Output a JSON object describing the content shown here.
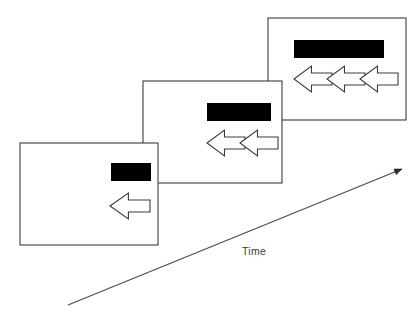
{
  "figure": {
    "name": "time-sequence-panels",
    "background_color": "#ffffff",
    "line_color": "#3c3c3c",
    "bar_color": "#000000",
    "width": 419,
    "height": 313
  },
  "axis": {
    "label": "Time",
    "label_color": "#3a3a3a",
    "start": {
      "x": 68,
      "y": 305
    },
    "end": {
      "x": 402,
      "y": 169
    },
    "arrowhead": "filled-triangle",
    "direction": "up-right"
  },
  "panels": [
    {
      "id": "panel-1",
      "order": 1,
      "position": "front-bottom-left",
      "rect": {
        "x": 20,
        "y": 143,
        "w": 138,
        "h": 102
      },
      "bar": {
        "x": 111,
        "y": 163,
        "w": 40,
        "h": 18
      },
      "arrow_count": 1,
      "arrow_direction": "left",
      "arrows": [
        {
          "x": 110,
          "y": 193,
          "w": 40,
          "h": 26
        }
      ]
    },
    {
      "id": "panel-2",
      "order": 2,
      "position": "middle",
      "rect": {
        "x": 143,
        "y": 81,
        "w": 139,
        "h": 102
      },
      "bar": {
        "x": 207,
        "y": 103,
        "w": 64,
        "h": 18
      },
      "arrow_count": 2,
      "arrow_direction": "left",
      "arrows": [
        {
          "x": 207,
          "y": 130,
          "w": 38,
          "h": 26
        },
        {
          "x": 240,
          "y": 130,
          "w": 38,
          "h": 26
        }
      ]
    },
    {
      "id": "panel-3",
      "order": 3,
      "position": "back-top-right",
      "rect": {
        "x": 268,
        "y": 18,
        "w": 138,
        "h": 102
      },
      "bar": {
        "x": 294,
        "y": 40,
        "w": 90,
        "h": 18
      },
      "arrow_count": 3,
      "arrow_direction": "left",
      "arrows": [
        {
          "x": 294,
          "y": 66,
          "w": 38,
          "h": 26
        },
        {
          "x": 327,
          "y": 66,
          "w": 38,
          "h": 26
        },
        {
          "x": 360,
          "y": 66,
          "w": 38,
          "h": 26
        }
      ]
    }
  ]
}
